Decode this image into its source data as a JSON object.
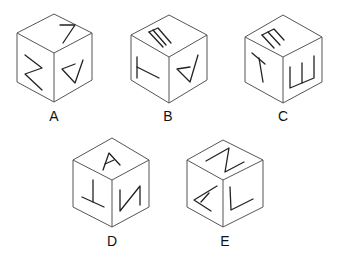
{
  "figure": {
    "type": "cube-folding-options",
    "options": [
      {
        "label": "A",
        "faces": {
          "top": "L (rotated)",
          "left": "Z (rotated)",
          "right": "A (inverted)"
        }
      },
      {
        "label": "B",
        "faces": {
          "top": "E (rotated)",
          "left": "T (rotated)",
          "right": "A (inverted)"
        }
      },
      {
        "label": "C",
        "faces": {
          "top": "E (rotated)",
          "left": "T",
          "right": "E (rotated)"
        }
      },
      {
        "label": "D",
        "faces": {
          "top": "A",
          "left": "T (inverted)",
          "right": "Z (rotated)"
        }
      },
      {
        "label": "E",
        "faces": {
          "top": "Z (rotated)",
          "left": "A (rotated)",
          "right": "L"
        }
      }
    ]
  }
}
